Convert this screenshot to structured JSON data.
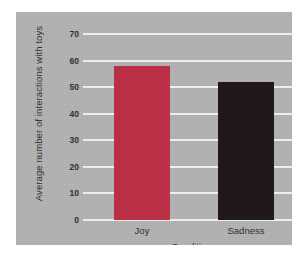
{
  "chart_data": {
    "type": "bar",
    "title": "",
    "categories": [
      "Joy",
      "Sadness"
    ],
    "values": [
      58,
      52
    ],
    "xlabel": "Conditions",
    "ylabel": "Average number of interactions with toys",
    "ylim": [
      0,
      70
    ],
    "ytick_step": 10,
    "yticks": [
      "70",
      "60",
      "50",
      "40",
      "30",
      "20",
      "10",
      "0"
    ],
    "grid": true,
    "legend": "none",
    "bar_colors": [
      "#be2a42",
      "#1a1113"
    ]
  },
  "colors": {
    "panel_background": "#b2b2b2",
    "page_background": "#ffffff",
    "gridline": "#f2f2f2",
    "text": "#2b2b2b",
    "bar_joy": "#be2a42",
    "bar_sadness": "#1a1113"
  }
}
